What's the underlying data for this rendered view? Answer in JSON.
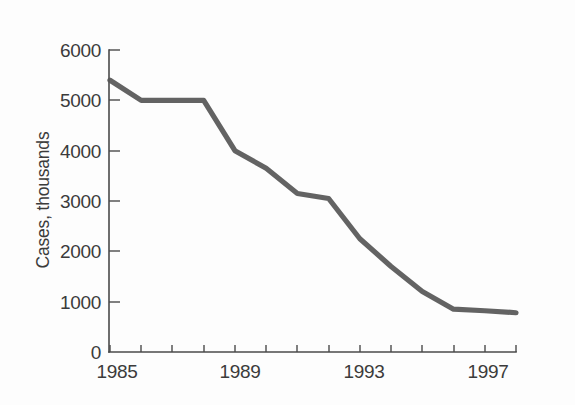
{
  "chart_data": {
    "type": "line",
    "title": "",
    "subtitle": "",
    "xlabel": "",
    "ylabel": "Cases, thousands",
    "x": [
      1985,
      1986,
      1987,
      1988,
      1989,
      1990,
      1991,
      1992,
      1993,
      1994,
      1995,
      1996,
      1997,
      1998
    ],
    "values": [
      5400,
      5000,
      5000,
      5000,
      4000,
      3650,
      3150,
      3050,
      2250,
      1700,
      1200,
      850,
      820,
      780
    ],
    "series": [
      {
        "name": "Cases, thousands",
        "values": [
          5400,
          5000,
          5000,
          5000,
          4000,
          3650,
          3150,
          3050,
          2250,
          1700,
          1200,
          850,
          820,
          780
        ]
      }
    ],
    "xlim": [
      1985,
      1998
    ],
    "ylim": [
      0,
      6000
    ],
    "xticks": [
      1985,
      1986,
      1987,
      1988,
      1989,
      1990,
      1991,
      1992,
      1993,
      1994,
      1995,
      1996,
      1997,
      1998
    ],
    "yticks": [
      0,
      1000,
      2000,
      3000,
      4000,
      5000,
      6000
    ],
    "x_tick_labels": [
      "1985",
      "",
      "",
      "",
      "1989",
      "",
      "",
      "",
      "1993",
      "",
      "",
      "",
      "1997",
      ""
    ],
    "y_tick_labels": [
      "0",
      "1000",
      "2000",
      "3000",
      "4000",
      "5000",
      "6000"
    ],
    "legend": [],
    "legend_position": "none",
    "grid": false,
    "annotations": [],
    "line_color": "#565656",
    "axis_color": "#4a4a4a",
    "background_color": "#fdfdfd"
  },
  "axis": {
    "y_title": "Cases, thousands",
    "y_labels": {
      "t0": "0",
      "t1000": "1000",
      "t2000": "2000",
      "t3000": "3000",
      "t4000": "4000",
      "t5000": "5000",
      "t6000": "6000"
    },
    "x_labels": {
      "l1985": "1985",
      "l1989": "1989",
      "l1993": "1993",
      "l1997": "1997"
    }
  }
}
